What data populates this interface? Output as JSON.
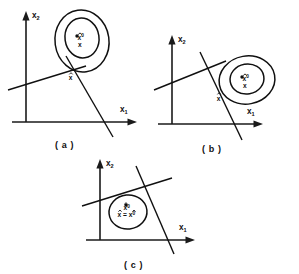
{
  "figure": {
    "panel_count": 3,
    "background_color": "#ffffff",
    "ink_color": "#101010"
  },
  "axis_labels": {
    "x1_base": "x",
    "x1_sub": "1",
    "x2_base": "x",
    "x2_sub": "2"
  },
  "panels": [
    {
      "id": "a",
      "caption": "( a )",
      "description": "Contour ellipses lie above the constraint boundary; the constrained solution x-hat sits on the active constraint where the line is tangent to a contour.",
      "axes": {
        "x_label_base": "x",
        "x_label_sub": "1",
        "y_label_base": "x",
        "y_label_sub": "2"
      },
      "contours": 2,
      "center_label_base": "x",
      "center_label_sup": "0",
      "center_label_hat": "x",
      "solution_label": "x",
      "constraint_lines": 2,
      "solution_on_constraint": true
    },
    {
      "id": "b",
      "caption": "( b )",
      "description": "Two constraint lines intersect to the left of the contour ellipses; x-hat lies on the boundary of the feasible region tangent to a contour.",
      "axes": {
        "x_label_base": "x",
        "x_label_sub": "1",
        "y_label_base": "x",
        "y_label_sub": "2"
      },
      "contours": 2,
      "center_label_base": "x",
      "center_label_sup": "0",
      "center_label_hat": "x",
      "solution_label": "x",
      "constraint_lines": 2,
      "solution_on_constraint": true
    },
    {
      "id": "c",
      "caption": "( c )",
      "description": "The unconstrained optimum lies strictly inside the feasible region, so the constrained and unconstrained estimates coincide.",
      "axes": {
        "x_label_base": "x",
        "x_label_sub": "1",
        "y_label_base": "x",
        "y_label_sub": "2"
      },
      "contours": 1,
      "center_label_base": "x",
      "center_label_sup": "0",
      "center_equation": "x = x",
      "center_equation_sup": "0",
      "constraint_lines": 2,
      "solution_on_constraint": false
    }
  ]
}
